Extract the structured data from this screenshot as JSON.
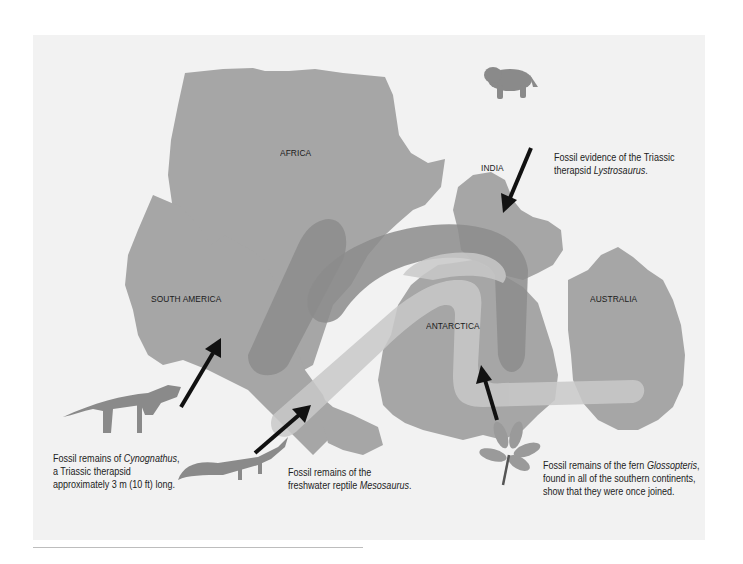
{
  "figure": {
    "background_color": "#f2f2f2",
    "land_color": "#a6a6a6",
    "band_dark_color": "#8c8c8c",
    "band_light_color": "#c9c9c9",
    "arrow_color": "#111111"
  },
  "continents": {
    "africa": "AFRICA",
    "india": "INDIA",
    "south_america": "SOUTH AMERICA",
    "antarctica": "ANTARCTICA",
    "australia": "AUSTRALIA"
  },
  "captions": {
    "lystrosaurus": {
      "line1": "Fossil evidence of the Triassic",
      "line2_prefix": "therapsid ",
      "line2_italic": "Lystrosaurus",
      "line2_suffix": "."
    },
    "cynognathus": {
      "line1_prefix": "Fossil remains of ",
      "line1_italic": "Cynognathus",
      "line1_suffix": ",",
      "line2": "a Triassic therapsid",
      "line3": "approximately 3 m (10 ft) long."
    },
    "mesosaurus": {
      "line1": "Fossil remains of the",
      "line2_prefix": "freshwater reptile ",
      "line2_italic": "Mesosaurus",
      "line2_suffix": "."
    },
    "glossopteris": {
      "line1_prefix": "Fossil remains of the fern ",
      "line1_italic": "Glossopteris",
      "line1_suffix": ",",
      "line2": "found in all of the southern continents,",
      "line3": "show that they were once joined."
    }
  },
  "icons": {
    "lystrosaurus": "lystrosaurus-illustration-icon",
    "cynognathus": "cynognathus-illustration-icon",
    "mesosaurus": "mesosaurus-illustration-icon",
    "glossopteris": "glossopteris-fern-icon"
  }
}
